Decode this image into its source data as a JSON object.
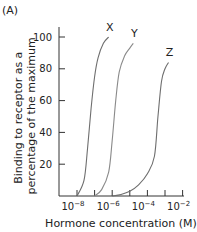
{
  "panel_label": "(A)",
  "chart_data": {
    "type": "line",
    "title": "",
    "xlabel": "Hormone concentration (M)",
    "ylabel": "Binding to receptor as a percentage of the maximum",
    "ylabel_lines": [
      "Binding to receptor as a",
      "percentage of the maximum"
    ],
    "xscale": "log",
    "xlim_exp": [
      -9,
      -2
    ],
    "ylim": [
      0,
      105
    ],
    "xtick_labels": [
      {
        "base": "10",
        "exp": "−8"
      },
      {
        "base": "10",
        "exp": "−6"
      },
      {
        "base": "10",
        "exp": "−4"
      },
      {
        "base": "10",
        "exp": "−2"
      }
    ],
    "xtick_label_exps": [
      -8,
      -6,
      -4,
      -2
    ],
    "xtick_minor_exps": [
      -7,
      -5,
      -3
    ],
    "ytick_labels": [
      "20",
      "40",
      "60",
      "80",
      "100"
    ],
    "ytick_values": [
      20,
      40,
      60,
      80,
      100
    ],
    "grid": false,
    "legend": "none (curves labeled directly)",
    "series": [
      {
        "name": "X",
        "color": "#6e6e6e",
        "log_x": [
          -8.0,
          -7.6,
          -7.4,
          -7.2,
          -7.0,
          -6.8,
          -6.5,
          -6.2
        ],
        "y": [
          0,
          10,
          30,
          55,
          75,
          87,
          96,
          100
        ]
      },
      {
        "name": "Y",
        "color": "#8a8a8a",
        "log_x": [
          -7.0,
          -6.6,
          -6.2,
          -6.0,
          -5.8,
          -5.6,
          -5.3,
          -5.0,
          -4.8
        ],
        "y": [
          0,
          4,
          15,
          35,
          60,
          78,
          88,
          93,
          96
        ]
      },
      {
        "name": "Z",
        "color": "#6e6e6e",
        "log_x": [
          -6.0,
          -5.5,
          -5.0,
          -4.5,
          -4.0,
          -3.6,
          -3.4,
          -3.2,
          -3.0,
          -2.8
        ],
        "y": [
          0,
          1,
          3,
          7,
          14,
          25,
          50,
          72,
          80,
          84
        ]
      }
    ]
  }
}
